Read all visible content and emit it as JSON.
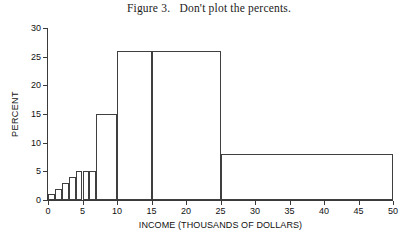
{
  "figure": {
    "title": "Figure 3.   Don't plot the percents."
  },
  "chart_data": {
    "type": "bar",
    "title": "Figure 3.   Don't plot the percents.",
    "xlabel": "INCOME (THOUSANDS OF DOLLARS)",
    "ylabel": "PERCENT",
    "xlim": [
      0,
      50
    ],
    "ylim": [
      0,
      30
    ],
    "xticks": [
      0,
      5,
      10,
      15,
      20,
      25,
      30,
      35,
      40,
      45,
      50
    ],
    "yticks": [
      0,
      5,
      10,
      15,
      20,
      25,
      30
    ],
    "xtick_labels": [
      "0",
      "5",
      "10",
      "15",
      "20",
      "25",
      "30",
      "35",
      "40",
      "45",
      "50"
    ],
    "ytick_labels": [
      "0",
      "5",
      "10",
      "15",
      "20",
      "25",
      "30"
    ],
    "grid": false,
    "legend": false,
    "bar_style": "histogram-unequal-bins-outline",
    "bins": [
      {
        "x0": 0,
        "x1": 1,
        "value": 1
      },
      {
        "x0": 1,
        "x1": 2,
        "value": 2
      },
      {
        "x0": 2,
        "x1": 3,
        "value": 3
      },
      {
        "x0": 3,
        "x1": 4,
        "value": 4
      },
      {
        "x0": 4,
        "x1": 5,
        "value": 5
      },
      {
        "x0": 5,
        "x1": 6,
        "value": 5
      },
      {
        "x0": 6,
        "x1": 7,
        "value": 5
      },
      {
        "x0": 7,
        "x1": 10,
        "value": 15
      },
      {
        "x0": 10,
        "x1": 15,
        "value": 26
      },
      {
        "x0": 15,
        "x1": 25,
        "value": 26
      },
      {
        "x0": 25,
        "x1": 50,
        "value": 8
      }
    ]
  }
}
